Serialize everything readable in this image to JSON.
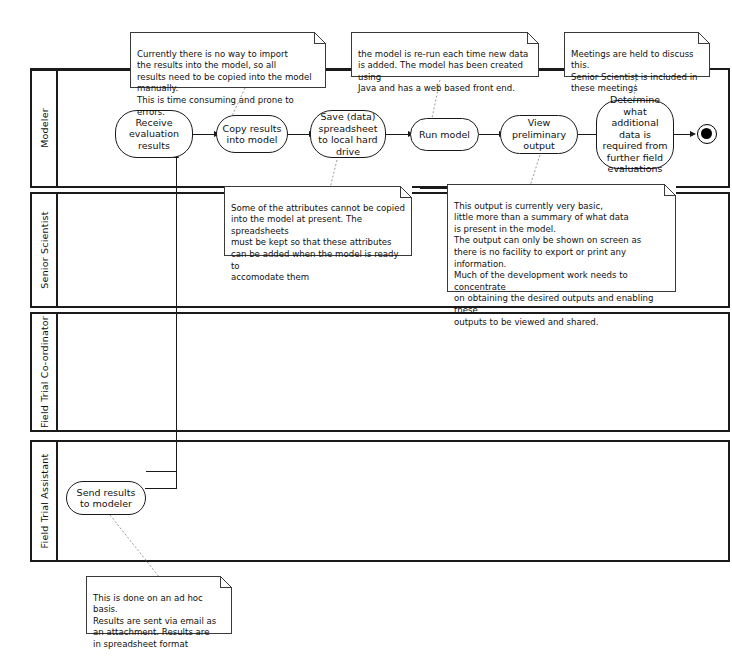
{
  "diagram": {
    "stroke_color": "#1a1a1a",
    "note_border_color": "#3a3a3a",
    "connector_dotted_color": "#8a8a8a",
    "background": "#ffffff"
  },
  "lanes": [
    {
      "id": "modeler",
      "label": "Modeler"
    },
    {
      "id": "senior-scientist",
      "label": "Senior Scientist"
    },
    {
      "id": "field-trial-coord",
      "label": "Field Trial Co-ordinator"
    },
    {
      "id": "field-trial-assist",
      "label": "Field Trial Assistant"
    }
  ],
  "activities": [
    {
      "id": "receive-evaluation-results",
      "label": "Receive\nevaluation\nresults"
    },
    {
      "id": "copy-results-into-model",
      "label": "Copy results\ninto model"
    },
    {
      "id": "save-data-spreadsheet",
      "label": "Save (data)\nspreadsheet to\nlocal hard drive"
    },
    {
      "id": "run-model",
      "label": "Run model"
    },
    {
      "id": "view-preliminary-output",
      "label": "View preliminary\noutput"
    },
    {
      "id": "determine-additional-data",
      "label": "Determine what\nadditional data\nis required from\nfurther field\nevaluations"
    },
    {
      "id": "send-results-to-modeler",
      "label": "Send results to\nmodeler"
    }
  ],
  "end_node": {
    "id": "activity-final-node",
    "label": ""
  },
  "notes": [
    {
      "id": "note-import-manual",
      "text": "Currently there is no way to import\nthe results into the model, so all\nresults need to be copied into the model manually.\nThis is time consuming and prone to errors."
    },
    {
      "id": "note-model-rerun",
      "text": "the model is re-run each time new data\nis added.  The model has been created using\nJava and has a web based front end."
    },
    {
      "id": "note-meetings",
      "text": "Meetings are held to discuss this.\nSenior Scientist is included in\nthese meetings"
    },
    {
      "id": "note-attributes-spreadsheets",
      "text": "Some of the attributes cannot be copied\ninto the model at present. The spreadsheets\nmust be kept so that these attributes\ncan be added when the model is ready to\naccomodate them"
    },
    {
      "id": "note-output-basic",
      "text": "This output is currently very basic,\nlittle more than a summary of what data\nis present in the model.\nThe output can only be shown on screen as\nthere is no facility to export or print any information.\nMuch of the development work needs to concentrate\non obtaining the desired outputs and enabling these\noutputs to be viewed and shared."
    },
    {
      "id": "note-ad-hoc-email",
      "text": "This is done on an ad hoc basis.\nResults are sent via email as\nan attachment. Results are\nin spreadsheet format"
    }
  ]
}
